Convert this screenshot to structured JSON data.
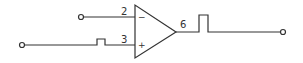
{
  "diagram": {
    "type": "op-amp-circuit",
    "colors": {
      "stroke": "#333333",
      "background": "#ffffff"
    },
    "opamp": {
      "inverting_pin": "2",
      "noninverting_pin": "3",
      "output_pin": "6",
      "inverting_sign": "−",
      "noninverting_sign": "+"
    },
    "inputs": [
      {
        "name": "inverting-input",
        "pin": "2",
        "signal": "none"
      },
      {
        "name": "non-inverting-input",
        "pin": "3",
        "signal": "small pulse"
      }
    ],
    "output": {
      "pin": "6",
      "signal": "large pulse"
    }
  }
}
